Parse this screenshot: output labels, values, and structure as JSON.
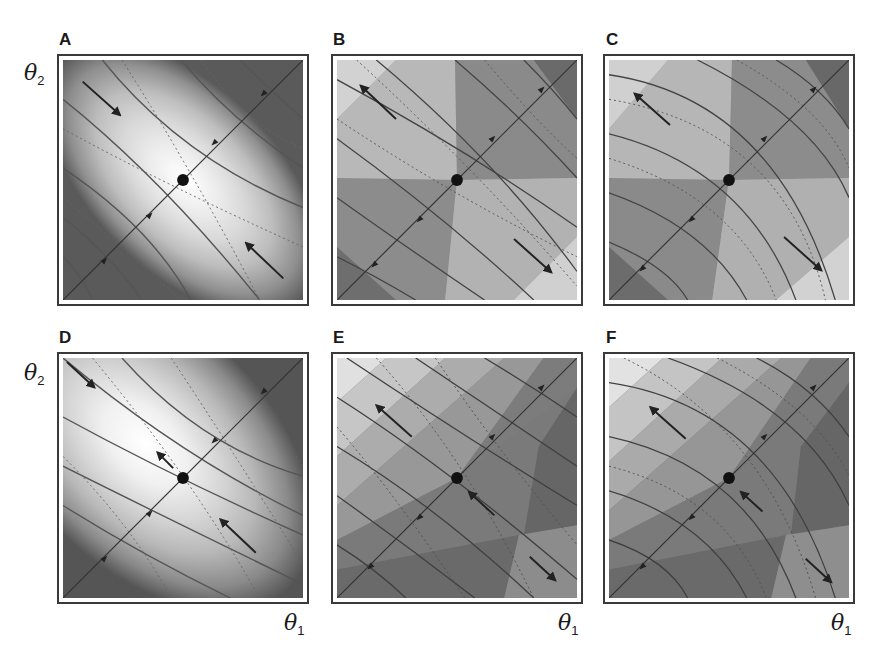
{
  "figure": {
    "panels": [
      {
        "id": "A",
        "label": "A",
        "description": "Elliptical contour landscape, light center, dark corners; stable saddle-free minimum at center; arrows converge toward center along anti-diagonal"
      },
      {
        "id": "B",
        "label": "B",
        "description": "Faceted gray landscape; arrows diverge along anti-diagonal away from center"
      },
      {
        "id": "C",
        "label": "C",
        "description": "Faceted gray landscape with curved solid contours; arrows diverge along anti-diagonal"
      },
      {
        "id": "D",
        "label": "D",
        "description": "Elliptical contour landscape offset upper-left; arrows converge toward center"
      },
      {
        "id": "E",
        "label": "E",
        "description": "Faceted landscape, light upper-left, dark lower-right; arrows diverge"
      },
      {
        "id": "F",
        "label": "F",
        "description": "Faceted landscape with curved contours, light upper-left, dark lower-right; arrows diverge"
      }
    ],
    "axes": {
      "y_label": "θ",
      "y_sub": "2",
      "x_label": "θ",
      "x_sub": "1"
    },
    "colors": {
      "frame": "#3a3a3a",
      "contour": "#4a4a4a",
      "fixed_point": "#111111",
      "light": "#f4f4f4",
      "dark": "#4e4e4e"
    }
  }
}
